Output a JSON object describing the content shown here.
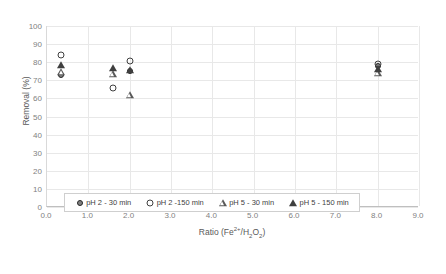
{
  "chart_data": {
    "type": "scatter",
    "title": "",
    "xlabel": "Ratio (Fe2+/H2O2)",
    "ylabel": "Removal (%)",
    "xlim": [
      0.0,
      9.0
    ],
    "ylim": [
      0,
      100
    ],
    "xticks": [
      "0.0",
      "1.0",
      "2.0",
      "3.0",
      "4.0",
      "5.0",
      "6.0",
      "7.0",
      "8.0",
      "9.0"
    ],
    "yticks": [
      "0",
      "10",
      "20",
      "30",
      "40",
      "50",
      "60",
      "70",
      "80",
      "90",
      "100"
    ],
    "grid": true,
    "legend_position": "inside-bottom-center",
    "series": [
      {
        "name": "pH 2 - 30 min",
        "marker": "filled-circle",
        "points": [
          {
            "x": 0.35,
            "y": 73.0
          },
          {
            "x": 2.0,
            "y": 75.0
          },
          {
            "x": 8.0,
            "y": 78.0
          }
        ]
      },
      {
        "name": "pH 2 -150 min",
        "marker": "open-circle",
        "points": [
          {
            "x": 0.35,
            "y": 84.0
          },
          {
            "x": 1.6,
            "y": 66.0
          },
          {
            "x": 2.0,
            "y": 80.5
          },
          {
            "x": 8.0,
            "y": 79.0
          }
        ]
      },
      {
        "name": "pH 5 - 30 min",
        "marker": "open-triangle",
        "points": [
          {
            "x": 0.35,
            "y": 74.5
          },
          {
            "x": 1.6,
            "y": 73.5
          },
          {
            "x": 2.0,
            "y": 62.0
          },
          {
            "x": 8.0,
            "y": 74.0
          }
        ]
      },
      {
        "name": "pH 5 - 150 min",
        "marker": "filled-triangle",
        "points": [
          {
            "x": 0.35,
            "y": 78.5
          },
          {
            "x": 1.6,
            "y": 77.0
          },
          {
            "x": 2.0,
            "y": 75.6
          },
          {
            "x": 8.0,
            "y": 76.0
          }
        ]
      }
    ]
  },
  "axes": {
    "ylabel_text": "Removal (%)",
    "xlabel_base": "Ratio (Fe",
    "xlabel_sup": "2+",
    "xlabel_mid": "/H",
    "xlabel_sub1": "2",
    "xlabel_o": "O",
    "xlabel_sub2": "2",
    "xlabel_close": ")"
  },
  "legend": {
    "entries": [
      {
        "label": "pH 2 - 30 min",
        "marker": "filled-circle"
      },
      {
        "label": "pH 2 -150 min",
        "marker": "open-circle"
      },
      {
        "label": "pH 5 - 30 min",
        "marker": "open-triangle"
      },
      {
        "label": "pH 5 - 150 min",
        "marker": "filled-triangle"
      }
    ]
  },
  "colors": {
    "grid": "#e8e8e8",
    "axis": "#bfbfbf",
    "tick_text": "#7f7f7f",
    "label_text": "#595959",
    "marker_dark": "#3f3f3f",
    "marker_fill": "#808080"
  }
}
